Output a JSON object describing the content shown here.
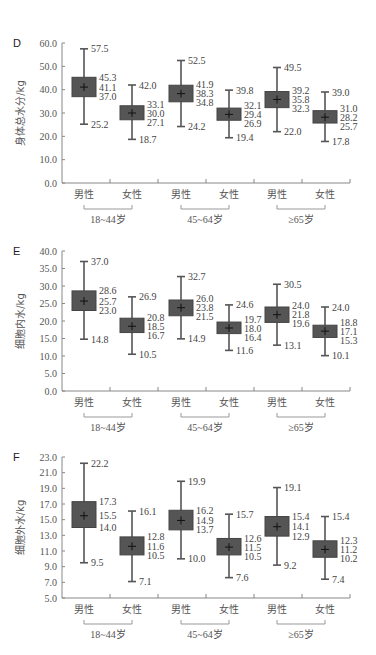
{
  "chart_data": [
    {
      "type": "boxplot",
      "panel": "D",
      "ylabel": "身体总水分/kg",
      "yticks": [
        "0.0",
        "10.0",
        "20.0",
        "30.0",
        "40.0",
        "50.0",
        "60.0"
      ],
      "ylim": [
        0,
        60
      ],
      "categories": [
        "男性",
        "女性",
        "男性",
        "女性",
        "男性",
        "女性"
      ],
      "groups": [
        "18~44岁",
        "45~64岁",
        "≥65岁"
      ],
      "boxes": [
        {
          "group": "18~44岁",
          "sex": "男性",
          "max": 57.5,
          "q3": 45.3,
          "median": 41.1,
          "q1": 37.0,
          "min": 25.2
        },
        {
          "group": "18~44岁",
          "sex": "女性",
          "max": 42.0,
          "q3": 33.1,
          "median": 30.0,
          "q1": 27.1,
          "min": 18.7
        },
        {
          "group": "45~64岁",
          "sex": "男性",
          "max": 52.5,
          "q3": 41.9,
          "median": 38.3,
          "q1": 34.8,
          "min": 24.2
        },
        {
          "group": "45~64岁",
          "sex": "女性",
          "max": 39.8,
          "q3": 32.1,
          "median": 29.4,
          "q1": 26.9,
          "min": 19.4
        },
        {
          "group": "≥65岁",
          "sex": "男性",
          "max": 49.5,
          "q3": 39.2,
          "median": 35.8,
          "q1": 32.3,
          "min": 22.0
        },
        {
          "group": "≥65岁",
          "sex": "女性",
          "max": 39.0,
          "q3": 31.0,
          "median": 28.2,
          "q1": 25.7,
          "min": 17.8
        }
      ]
    },
    {
      "type": "boxplot",
      "panel": "E",
      "ylabel": "细胞内水/kg",
      "yticks": [
        "0.0",
        "5.0",
        "10.0",
        "15.0",
        "20.0",
        "25.0",
        "30.0",
        "35.0",
        "40.0"
      ],
      "ylim": [
        0,
        40
      ],
      "categories": [
        "男性",
        "女性",
        "男性",
        "女性",
        "男性",
        "女性"
      ],
      "groups": [
        "18~44岁",
        "45~64岁",
        "≥65岁"
      ],
      "boxes": [
        {
          "group": "18~44岁",
          "sex": "男性",
          "max": 37.0,
          "q3": 28.6,
          "median": 25.7,
          "q1": 23.0,
          "min": 14.8
        },
        {
          "group": "18~44岁",
          "sex": "女性",
          "max": 26.9,
          "q3": 20.8,
          "median": 18.5,
          "q1": 16.7,
          "min": 10.5
        },
        {
          "group": "45~64岁",
          "sex": "男性",
          "max": 32.7,
          "q3": 26.0,
          "median": 23.8,
          "q1": 21.5,
          "min": 14.9
        },
        {
          "group": "45~64岁",
          "sex": "女性",
          "max": 24.6,
          "q3": 19.7,
          "median": 18.0,
          "q1": 16.4,
          "min": 11.6
        },
        {
          "group": "≥65岁",
          "sex": "男性",
          "max": 30.5,
          "q3": 24.0,
          "median": 21.8,
          "q1": 19.6,
          "min": 13.1
        },
        {
          "group": "≥65岁",
          "sex": "女性",
          "max": 24.0,
          "q3": 18.8,
          "median": 17.1,
          "q1": 15.3,
          "min": 10.1
        }
      ]
    },
    {
      "type": "boxplot",
      "panel": "F",
      "ylabel": "细胞外水/kg",
      "yticks": [
        "5.0",
        "7.0",
        "9.0",
        "11.0",
        "13.0",
        "15.0",
        "17.0",
        "19.0",
        "21.0",
        "23.0"
      ],
      "ylim": [
        5,
        23
      ],
      "categories": [
        "男性",
        "女性",
        "男性",
        "女性",
        "男性",
        "女性"
      ],
      "groups": [
        "18~44岁",
        "45~64岁",
        "≥65岁"
      ],
      "boxes": [
        {
          "group": "18~44岁",
          "sex": "男性",
          "max": 22.2,
          "q3": 17.3,
          "median": 15.5,
          "q1": 14.0,
          "min": 9.5
        },
        {
          "group": "18~44岁",
          "sex": "女性",
          "max": 16.1,
          "q3": 12.8,
          "median": 11.6,
          "q1": 10.5,
          "min": 7.1
        },
        {
          "group": "45~64岁",
          "sex": "男性",
          "max": 19.9,
          "q3": 16.2,
          "median": 14.9,
          "q1": 13.7,
          "min": 10.0
        },
        {
          "group": "45~64岁",
          "sex": "女性",
          "max": 15.7,
          "q3": 12.6,
          "median": 11.5,
          "q1": 10.5,
          "min": 7.6
        },
        {
          "group": "≥65岁",
          "sex": "男性",
          "max": 19.1,
          "q3": 15.4,
          "median": 14.1,
          "q1": 12.9,
          "min": 9.2
        },
        {
          "group": "≥65岁",
          "sex": "女性",
          "max": 15.4,
          "q3": 12.3,
          "median": 11.2,
          "q1": 10.2,
          "min": 7.4
        }
      ]
    }
  ],
  "layout": {
    "panels": [
      {
        "top": 43,
        "bottom": 183
      },
      {
        "top": 251,
        "bottom": 391
      },
      {
        "top": 457,
        "bottom": 598
      }
    ],
    "x_left": 62,
    "x_right": 350,
    "box_centers": [
      84,
      132,
      181,
      229,
      277,
      325
    ],
    "box_width": 24,
    "colors": {
      "box_fill": "#555555",
      "whisker": "#555555",
      "axis": "#888888",
      "mean_marker": "#111111"
    }
  }
}
